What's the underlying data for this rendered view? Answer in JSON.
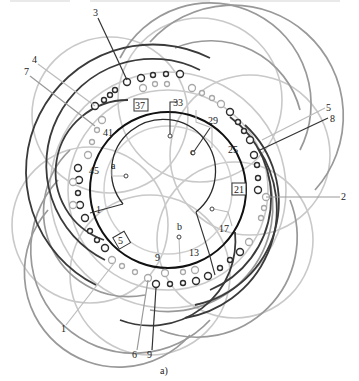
{
  "figure": {
    "caption": "a)",
    "type": "stator winding connection diagram",
    "center": [
      168,
      190
    ],
    "radii": {
      "inner": 52,
      "middle": 64,
      "slot_circle": 78
    }
  },
  "colors": {
    "black": "#1a1a1a",
    "dark_gray": "#555555",
    "mid_gray": "#8c8c8c",
    "light_gray": "#c4c4c4",
    "paper": "#ffffff"
  },
  "phase_taps": [
    {
      "label": "a",
      "pos": [
        126,
        176
      ]
    },
    {
      "label": "b",
      "pos": [
        179,
        237
      ]
    },
    {
      "label": "c",
      "pos": [
        193,
        153
      ]
    }
  ],
  "slot_numbers": [
    {
      "label": "1",
      "pos": [
        98,
        210
      ]
    },
    {
      "label": "5",
      "pos": [
        121,
        243
      ],
      "boxed": true
    },
    {
      "label": "9",
      "pos": [
        158,
        263
      ]
    },
    {
      "label": "13",
      "pos": [
        194,
        255
      ]
    },
    {
      "label": "17",
      "pos": [
        224,
        230
      ]
    },
    {
      "label": "21",
      "pos": [
        238,
        192
      ],
      "boxed": true
    },
    {
      "label": "25",
      "pos": [
        232,
        151
      ]
    },
    {
      "label": "29",
      "pos": [
        212,
        122
      ]
    },
    {
      "label": "33",
      "pos": [
        178,
        104
      ]
    },
    {
      "label": "37",
      "pos": [
        140,
        108
      ],
      "boxed": true
    },
    {
      "label": "41",
      "pos": [
        108,
        134
      ]
    },
    {
      "label": "45",
      "pos": [
        95,
        171
      ]
    }
  ],
  "lead_labels": [
    {
      "label": "3",
      "pos": [
        96,
        15
      ]
    },
    {
      "label": "4",
      "pos": [
        35,
        61
      ]
    },
    {
      "label": "7",
      "pos": [
        26,
        73
      ]
    },
    {
      "label": "5",
      "pos": [
        328,
        107
      ]
    },
    {
      "label": "8",
      "pos": [
        331,
        119
      ]
    },
    {
      "label": "2",
      "pos": [
        343,
        197
      ]
    },
    {
      "label": "1",
      "pos": [
        63,
        329
      ]
    },
    {
      "label": "6",
      "pos": [
        135,
        355
      ]
    },
    {
      "label": "9",
      "pos": [
        150,
        355
      ]
    },
    {
      "label": "9",
      "pos": [
        179,
        364
      ]
    }
  ]
}
